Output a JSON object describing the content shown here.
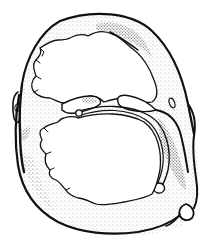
{
  "illustration": {
    "subject": "ring-shaped bone line drawing",
    "style": "pen-and-ink stippled illustration",
    "colors": {
      "background": "#ffffff",
      "ink": "#111111",
      "shade": "#6b6b6b"
    },
    "parts": [
      {
        "name": "outer-ring",
        "label": ""
      },
      {
        "name": "upper-opening",
        "label": ""
      },
      {
        "name": "lower-opening",
        "label": ""
      },
      {
        "name": "inner-ligament-band",
        "label": ""
      },
      {
        "name": "right-process",
        "label": ""
      },
      {
        "name": "left-process",
        "label": ""
      }
    ]
  }
}
